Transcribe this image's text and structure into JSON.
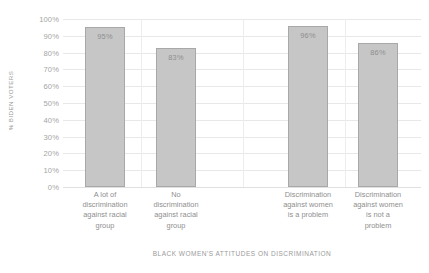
{
  "chart_data": {
    "type": "bar",
    "title": "",
    "xlabel": "BLACK WOMEN'S ATTITUDES ON DISCRIMINATION",
    "ylabel": "% BIDEN VOTERS",
    "categories": [
      "A lot of discrimination against racial group",
      "No discrimination against racial group",
      "Discrimination against women is a problem",
      "Discrimination against women is not a problem"
    ],
    "category_lines": [
      [
        "A lot of",
        "discrimination",
        "against racial",
        "group"
      ],
      [
        "No",
        "discrimination",
        "against racial",
        "group"
      ],
      [
        "Discrimination",
        "against women",
        "is a problem"
      ],
      [
        "Discrimination",
        "against women",
        "is not a",
        "problem"
      ]
    ],
    "values": [
      95,
      83,
      96,
      86
    ],
    "data_labels": [
      "95%",
      "83%",
      "96%",
      "86%"
    ],
    "ylim": [
      0,
      100
    ],
    "ytick_values": [
      100,
      90,
      80,
      70,
      60,
      50,
      40,
      30,
      20,
      10,
      0
    ],
    "ytick_labels": [
      "100%",
      "90%",
      "80%",
      "70%",
      "60%",
      "50%",
      "40%",
      "30%",
      "20%",
      "10%",
      "0%"
    ],
    "grid": "horizontal",
    "legend": "none",
    "bar_color": "#c6c6c6",
    "bar_border_color": "#a8a8a8",
    "gridline_color": "#e8e8e8",
    "text_color": "#8f8f8f"
  }
}
